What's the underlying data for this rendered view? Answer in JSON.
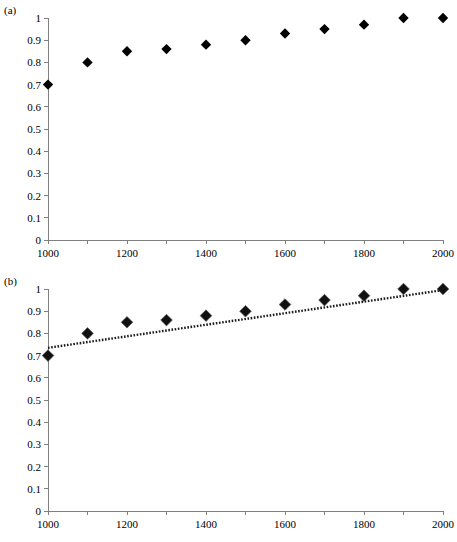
{
  "figure": {
    "background_color": "#ffffff",
    "marker_color": "#000000",
    "axis_color": "#808080",
    "trendline_color": "#1a1a1a"
  },
  "panels": [
    {
      "label": "(a)",
      "has_trendline": false
    },
    {
      "label": "(b)",
      "has_trendline": true
    }
  ],
  "chart_data": [
    {
      "type": "scatter",
      "panel": "(a)",
      "title": "",
      "xlabel": "",
      "ylabel": "",
      "x": [
        1000,
        1100,
        1200,
        1300,
        1400,
        1500,
        1600,
        1700,
        1800,
        1900,
        2000
      ],
      "values": [
        0.7,
        0.8,
        0.85,
        0.86,
        0.88,
        0.9,
        0.93,
        0.95,
        0.97,
        1.0,
        1.0
      ],
      "xlim": [
        1000,
        2000
      ],
      "ylim": [
        0,
        1
      ],
      "xticks": [
        1000,
        1100,
        1200,
        1300,
        1400,
        1500,
        1600,
        1700,
        1800,
        1900,
        2000
      ],
      "xticklabels": [
        "1000",
        "",
        "1200",
        "",
        "1400",
        "",
        "1600",
        "",
        "1800",
        "",
        "2000"
      ],
      "yticks": [
        0,
        0.1,
        0.2,
        0.3,
        0.4,
        0.5,
        0.6,
        0.7,
        0.8,
        0.9,
        1
      ],
      "yticklabels": [
        "0",
        "0.1",
        "0.2",
        "0.3",
        "0.4",
        "0.5",
        "0.6",
        "0.7",
        "0.8",
        "0.9",
        "1"
      ],
      "grid": false,
      "legend": false,
      "marker": "diamond"
    },
    {
      "type": "scatter",
      "panel": "(b)",
      "title": "",
      "xlabel": "",
      "ylabel": "",
      "x": [
        1000,
        1100,
        1200,
        1300,
        1400,
        1500,
        1600,
        1700,
        1800,
        1900,
        2000
      ],
      "values": [
        0.7,
        0.8,
        0.85,
        0.86,
        0.88,
        0.9,
        0.93,
        0.95,
        0.97,
        1.0,
        1.0
      ],
      "trendline": {
        "type": "line",
        "style": "dotted",
        "x": [
          1000,
          2000
        ],
        "values": [
          0.735,
          0.995
        ]
      },
      "xlim": [
        1000,
        2000
      ],
      "ylim": [
        0,
        1
      ],
      "xticks": [
        1000,
        1100,
        1200,
        1300,
        1400,
        1500,
        1600,
        1700,
        1800,
        1900,
        2000
      ],
      "xticklabels": [
        "1000",
        "",
        "1200",
        "",
        "1400",
        "",
        "1600",
        "",
        "1800",
        "",
        "2000"
      ],
      "yticks": [
        0,
        0.1,
        0.2,
        0.3,
        0.4,
        0.5,
        0.6,
        0.7,
        0.8,
        0.9,
        1
      ],
      "yticklabels": [
        "0",
        "0.1",
        "0.2",
        "0.3",
        "0.4",
        "0.5",
        "0.6",
        "0.7",
        "0.8",
        "0.9",
        "1"
      ],
      "grid": false,
      "legend": false,
      "marker": "diamond"
    }
  ]
}
